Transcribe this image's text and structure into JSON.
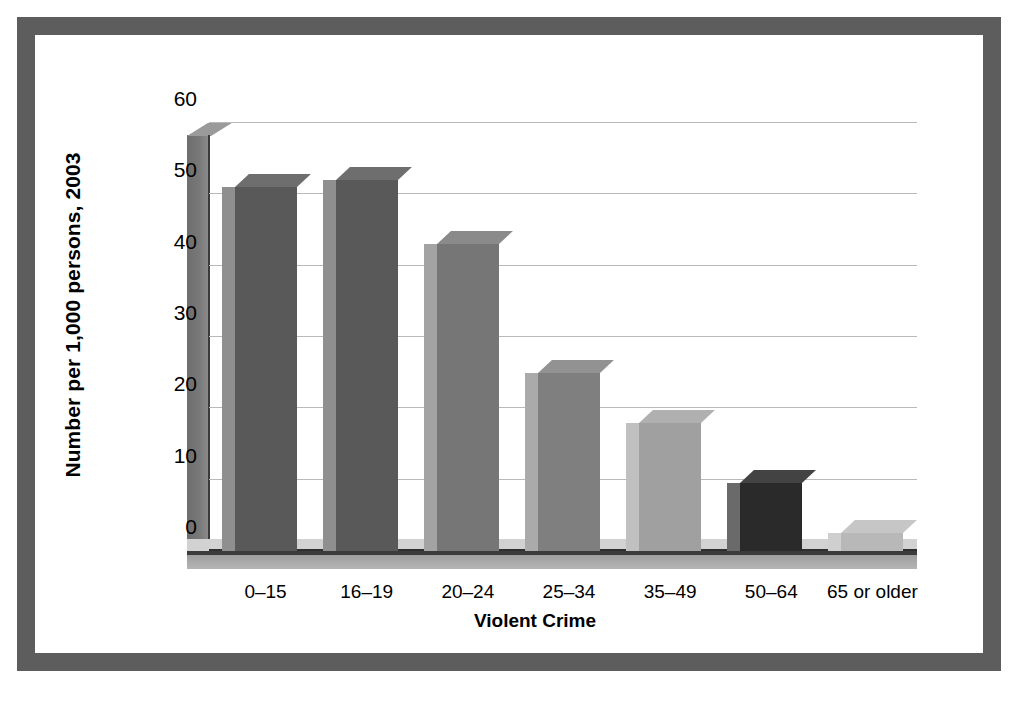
{
  "figure": {
    "frame_color": "#5d5d5d",
    "background": "#ffffff"
  },
  "chart_data": {
    "type": "bar",
    "title": "",
    "xlabel": "Violent Crime",
    "ylabel": "Number per 1,000 persons, 2003",
    "categories": [
      "0–15",
      "16–19",
      "20–24",
      "25–34",
      "35–49",
      "50–64",
      "65 or older"
    ],
    "values": [
      51,
      52,
      43,
      25,
      18,
      9.5,
      2.5
    ],
    "values_back": [
      53,
      54,
      44,
      27,
      19,
      11,
      3.5
    ],
    "ylim": [
      0,
      60
    ],
    "yticks": [
      0,
      10,
      20,
      30,
      40,
      50,
      60
    ],
    "ytick_labels": [
      "0",
      "10",
      "20",
      "30",
      "40",
      "50",
      "60"
    ],
    "grid": true,
    "legend": false,
    "style": "3d-column",
    "bar_colors": [
      "#595959",
      "#595959",
      "#767676",
      "#7f7f7f",
      "#a0a0a0",
      "#2a2a2a",
      "#b8b8b8"
    ],
    "bar_side_colors": [
      "#8f8f8f",
      "#8f8f8f",
      "#a3a3a3",
      "#aaaaaa",
      "#c0c0c0",
      "#6a6a6a",
      "#cfcfcf"
    ],
    "bar_top_colors": [
      "#6e6e6e",
      "#6e6e6e",
      "#8a8a8a",
      "#929292",
      "#b0b0b0",
      "#434343",
      "#c6c6c6"
    ]
  },
  "axes": {
    "y_title": "Number per 1,000 persons, 2003",
    "x_title": "Violent Crime"
  }
}
